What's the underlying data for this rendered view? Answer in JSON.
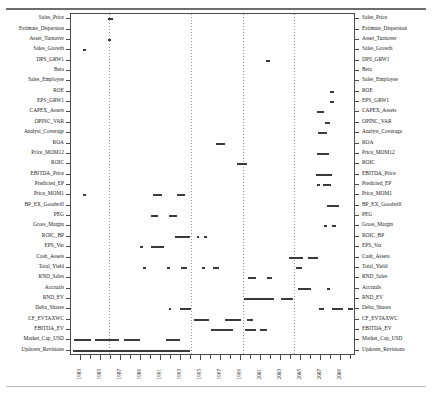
{
  "chart_data": {
    "type": "bar",
    "title": "",
    "subtitle": "",
    "xlabel": "",
    "ylabel": "",
    "orientation": "horizontal-timeline",
    "grid": "vertical-dashed",
    "legend": null,
    "xlim": [
      1982.0,
      2010.5
    ],
    "xtick_labels": [
      "1983",
      "1985",
      "1987",
      "1989",
      "1991",
      "1993",
      "1995",
      "1997",
      "1999",
      "2001",
      "2003",
      "2005",
      "2007",
      "2009"
    ],
    "xtick_values": [
      1983,
      1985,
      1987,
      1989,
      1991,
      1993,
      1995,
      1997,
      1999,
      2001,
      2003,
      2005,
      2007,
      2009
    ],
    "xtick_minor_values": [
      1984,
      1986,
      1988,
      1990,
      1992,
      1994,
      1996,
      1998,
      2000,
      2002,
      2004,
      2006,
      2008,
      2010
    ],
    "gridline_values": [
      1985.8,
      1994.0,
      1999.2,
      2004.3
    ],
    "categories": [
      "Sales_Price",
      "Estimate_Dispersion",
      "Asset_Turnover",
      "Sales_Growth",
      "DPS_GRW1",
      "Beta",
      "Sales_Employee",
      "ROE",
      "EPS_GRW1",
      "CAPEX_Assets",
      "OPINC_VAR",
      "Analyst_Coverage",
      "ROA",
      "Price_MOM12",
      "ROIC",
      "EBITDA_Price",
      "Predicted_EP",
      "Price_MOM1",
      "BP_EX_Goodwill",
      "PEG",
      "Gross_Margin",
      "ROIC_BP",
      "EPS_Var",
      "Cash_Assets",
      "Total_Yield",
      "RND_Sales",
      "Accruals",
      "RND_EV",
      "Delta_Shares",
      "CF_EVTAXWC",
      "EBITDA_EV",
      "Market_Cap_USD",
      "Updown_Revisions"
    ],
    "series": [
      {
        "name": "Sales_Price",
        "spans": [
          [
            1985.7,
            1986.2
          ]
        ]
      },
      {
        "name": "Estimate_Dispersion",
        "spans": []
      },
      {
        "name": "Asset_Turnover",
        "spans": [
          [
            1985.7,
            1986.0
          ]
        ]
      },
      {
        "name": "Sales_Growth",
        "spans": [
          [
            1983.2,
            1983.5
          ]
        ]
      },
      {
        "name": "DPS_GRW1",
        "spans": [
          [
            2001.5,
            2001.9
          ]
        ]
      },
      {
        "name": "Beta",
        "spans": []
      },
      {
        "name": "Sales_Employee",
        "spans": []
      },
      {
        "name": "ROE",
        "spans": [
          [
            2007.9,
            2008.3
          ]
        ]
      },
      {
        "name": "EPS_GRW1",
        "spans": [
          [
            2007.9,
            2008.3
          ]
        ]
      },
      {
        "name": "CAPEX_Assets",
        "spans": [
          [
            2006.6,
            2007.3
          ]
        ]
      },
      {
        "name": "OPINC_VAR",
        "spans": [
          [
            2007.4,
            2007.9
          ]
        ]
      },
      {
        "name": "Analyst_Coverage",
        "spans": [
          [
            2006.7,
            2007.6
          ]
        ]
      },
      {
        "name": "ROA",
        "spans": [
          [
            1996.5,
            1997.4
          ]
        ]
      },
      {
        "name": "Price_MOM12",
        "spans": [
          [
            2006.6,
            2007.8
          ]
        ]
      },
      {
        "name": "ROIC",
        "spans": [
          [
            1998.6,
            1999.6
          ]
        ]
      },
      {
        "name": "EBITDA_Price",
        "spans": [
          [
            2006.5,
            2008.1
          ]
        ]
      },
      {
        "name": "Predicted_EP",
        "spans": [
          [
            2006.6,
            2006.9
          ],
          [
            2007.2,
            2008.0
          ]
        ]
      },
      {
        "name": "Price_MOM1",
        "spans": [
          [
            1983.2,
            1983.5
          ],
          [
            1990.2,
            1991.1
          ],
          [
            1992.6,
            1993.4
          ]
        ]
      },
      {
        "name": "BP_EX_Goodwill",
        "spans": [
          [
            2007.6,
            2008.8
          ]
        ]
      },
      {
        "name": "PEG",
        "spans": [
          [
            1990.0,
            1990.7
          ],
          [
            1991.8,
            1992.6
          ]
        ]
      },
      {
        "name": "Gross_Margin",
        "spans": [
          [
            2007.3,
            2007.6
          ],
          [
            2008.1,
            2008.5
          ]
        ]
      },
      {
        "name": "ROIC_BP",
        "spans": [
          [
            1992.4,
            1993.9
          ],
          [
            1994.6,
            1994.8
          ],
          [
            1995.3,
            1995.6
          ]
        ]
      },
      {
        "name": "EPS_Var",
        "spans": [
          [
            1988.9,
            1989.2
          ],
          [
            1990.0,
            1991.3
          ]
        ]
      },
      {
        "name": "Cash_Assets",
        "spans": [
          [
            2003.8,
            2005.2
          ],
          [
            2005.7,
            2006.7
          ]
        ]
      },
      {
        "name": "Total_Yield",
        "spans": [
          [
            1989.2,
            1989.5
          ],
          [
            1991.6,
            1991.9
          ],
          [
            1993.0,
            1993.6
          ],
          [
            1995.1,
            1995.4
          ],
          [
            1996.2,
            1996.8
          ],
          [
            2004.5,
            2005.1
          ]
        ]
      },
      {
        "name": "RND_Sales",
        "spans": [
          [
            1999.7,
            2000.5
          ],
          [
            2001.6,
            2002.1
          ]
        ]
      },
      {
        "name": "Accruals",
        "spans": [
          [
            2004.7,
            2006.0
          ],
          [
            2007.6,
            2007.9
          ]
        ]
      },
      {
        "name": "RND_EV",
        "spans": [
          [
            1999.3,
            2002.3
          ],
          [
            2003.0,
            2004.2
          ]
        ]
      },
      {
        "name": "Delta_Shares",
        "spans": [
          [
            1991.8,
            1992.0
          ],
          [
            1992.9,
            1994.0
          ],
          [
            2006.8,
            2007.3
          ],
          [
            2008.1,
            2009.2
          ],
          [
            2009.7,
            2010.2
          ]
        ]
      },
      {
        "name": "CF_EVTAXWC",
        "spans": [
          [
            1994.3,
            1995.8
          ],
          [
            1997.4,
            1999.0
          ],
          [
            1999.6,
            2000.2
          ]
        ]
      },
      {
        "name": "EBITDA_EV",
        "spans": [
          [
            1996.0,
            1998.2
          ],
          [
            1999.4,
            2000.5
          ],
          [
            2000.9,
            2001.6
          ]
        ]
      },
      {
        "name": "Market_Cap_USD",
        "spans": [
          [
            1982.3,
            1984.0
          ],
          [
            1984.4,
            1986.8
          ],
          [
            1987.3,
            1988.9
          ],
          [
            1991.5,
            1992.9
          ]
        ]
      },
      {
        "name": "Updown_Revisions",
        "spans": [
          [
            1982.2,
            1993.9
          ]
        ]
      }
    ]
  },
  "axes": {
    "left_labels": [
      "Sales_Price",
      "Estimate_Dispersion",
      "Asset_Turnover",
      "Sales_Growth",
      "DPS_GRW1",
      "Beta",
      "Sales_Employee",
      "ROE",
      "EPS_GRW1",
      "CAPEX_Assets",
      "OPINC_VAR",
      "Analyst_Coverage",
      "ROA",
      "Price_MOM12",
      "ROIC",
      "EBITDA_Price",
      "Predicted_EP",
      "Price_MOM1",
      "BP_EX_Goodwill",
      "PEG",
      "Gross_Margin",
      "ROIC_BP",
      "EPS_Var",
      "Cash_Assets",
      "Total_Yield",
      "RND_Sales",
      "Accruals",
      "RND_EV",
      "Delta_Shares",
      "CF_EVTAXWC",
      "EBITDA_EV",
      "Market_Cap_USD",
      "Updown_Revisions"
    ],
    "right_labels": [
      "Sales_Price",
      "Estimate_Dispersion",
      "Asset_Turnover",
      "Sales_Growth",
      "DPS_GRW1",
      "Beta",
      "Sales_Employee",
      "ROE",
      "EPS_GRW1",
      "CAPEX_Assets",
      "OPINC_VAR",
      "Analyst_Coverage",
      "ROA",
      "Price_MOM12",
      "ROIC",
      "EBITDA_Price",
      "Predicted_EP",
      "Price_MOM1",
      "BP_EX_Goodwill",
      "PEG",
      "Gross_Margin",
      "ROIC_BP",
      "EPS_Var",
      "Cash_Assets",
      "Total_Yield",
      "RND_Sales",
      "Accruals",
      "RND_EV",
      "Delta_Shares",
      "CF_EVTAXWC",
      "EBITDA_EV",
      "Market_Cap_USD",
      "Updown_Revisions"
    ]
  },
  "style": {
    "mark_color": "#3a3a3a",
    "frame_color": "#4a4a4a",
    "grid_color": "#9a9a9a",
    "background": "#ffffff"
  }
}
